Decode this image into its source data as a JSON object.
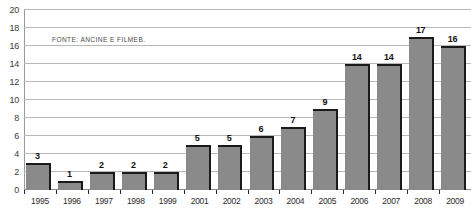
{
  "chart_data": {
    "type": "bar",
    "title": "",
    "subtitle": "",
    "xlabel": "",
    "ylabel": "",
    "ylim": [
      0,
      20
    ],
    "ytick_step": 2,
    "yticks": [
      0,
      2,
      4,
      6,
      8,
      10,
      12,
      14,
      16,
      18,
      20
    ],
    "grid": true,
    "legend": false,
    "categories": [
      "1995",
      "1996",
      "1997",
      "1998",
      "1999",
      "2001",
      "2002",
      "2003",
      "2004",
      "2005",
      "2006",
      "2007",
      "2008",
      "2009"
    ],
    "values": [
      3,
      1,
      2,
      2,
      2,
      5,
      5,
      6,
      7,
      9,
      14,
      14,
      17,
      16
    ],
    "annotations": [
      "FONTE: ANCINE E FILMEB."
    ],
    "bar_color": "#8a8a8a",
    "bar_edge_color": "#1a1a1a",
    "gridline_color": "#b8b8b8",
    "axis_color": "#8d8d8d"
  },
  "source_note": "FONTE: ANCINE E FILMEB."
}
